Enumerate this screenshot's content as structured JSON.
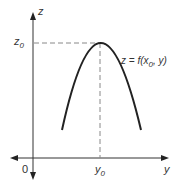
{
  "diagram": {
    "axes": {
      "vertical_label": "z",
      "horizontal_label": "y",
      "origin_label": "0"
    },
    "markers": {
      "z_level": {
        "base": "z",
        "sub": "0"
      },
      "y_level": {
        "base": "y",
        "sub": "0"
      }
    },
    "curve_label": {
      "prefix": "z = f(x",
      "sub": "0",
      "suffix": ", y)"
    },
    "colors": {
      "axis": "#333333",
      "curve": "#222222",
      "dash": "#888888"
    }
  }
}
